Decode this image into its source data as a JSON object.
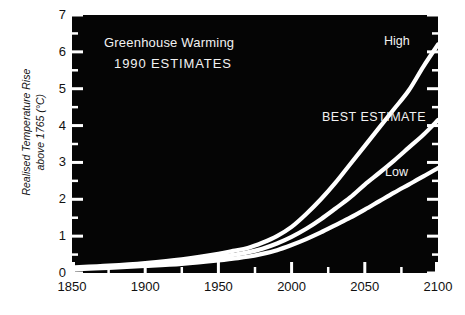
{
  "chart_data": {
    "type": "line",
    "title": "Greenhouse Warming",
    "subtitle": "1990 ESTIMATES",
    "xlabel": "",
    "ylabel": "Realised Temperature Rise above 1765 (°C)",
    "ylabel_line1": "Realised Temperature Rise",
    "ylabel_line2": "above 1765 (°C)",
    "xlim": [
      1850,
      2100
    ],
    "ylim": [
      0,
      7
    ],
    "xticks": [
      1850,
      1900,
      1950,
      2000,
      2050,
      2100
    ],
    "xtick_labels": [
      "1850",
      "1900",
      "1950",
      "2000",
      "2050",
      "2100"
    ],
    "xminor_step": 25,
    "yticks": [
      0,
      1,
      2,
      3,
      4,
      5,
      6,
      7
    ],
    "ytick_labels": [
      "0",
      "1",
      "2",
      "3",
      "4",
      "5",
      "6",
      "7"
    ],
    "yminor_step": 0.5,
    "grid": false,
    "legend_position": "inline-right",
    "plot_background": "#050505",
    "line_color": "#ffffff",
    "text_color": "#111111",
    "x": [
      1850,
      1875,
      1900,
      1925,
      1950,
      1960,
      1970,
      1980,
      1990,
      2000,
      2010,
      2020,
      2030,
      2040,
      2050,
      2060,
      2070,
      2080,
      2090,
      2100
    ],
    "series": [
      {
        "name": "High",
        "label": "High",
        "values": [
          0.15,
          0.2,
          0.27,
          0.37,
          0.52,
          0.6,
          0.68,
          0.82,
          1.0,
          1.25,
          1.6,
          2.0,
          2.45,
          2.95,
          3.45,
          3.95,
          4.45,
          4.95,
          5.6,
          6.2
        ]
      },
      {
        "name": "Best estimate",
        "label": "BEST ESTIMATE",
        "values": [
          0.12,
          0.17,
          0.23,
          0.31,
          0.43,
          0.49,
          0.56,
          0.66,
          0.8,
          0.98,
          1.2,
          1.46,
          1.75,
          2.05,
          2.4,
          2.72,
          3.05,
          3.4,
          3.75,
          4.15
        ]
      },
      {
        "name": "Low",
        "label": "Low",
        "values": [
          0.1,
          0.14,
          0.19,
          0.25,
          0.34,
          0.39,
          0.44,
          0.52,
          0.62,
          0.76,
          0.92,
          1.1,
          1.3,
          1.5,
          1.72,
          1.95,
          2.18,
          2.4,
          2.62,
          2.85
        ]
      }
    ]
  }
}
